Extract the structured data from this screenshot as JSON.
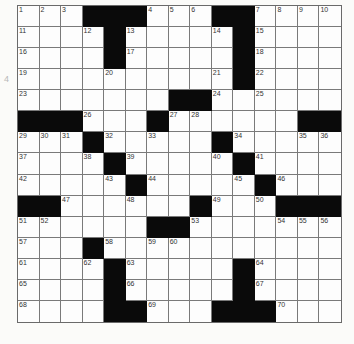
{
  "puzzle": {
    "type": "crossword",
    "rows": 15,
    "cols": 15,
    "colors": {
      "block": "#0a0a0a",
      "cell": "#fdfdfd",
      "gridline": "#7a7a7a",
      "background": "#fbfbf9"
    },
    "margin_mark": "4",
    "grid": [
      [
        "1",
        "2",
        "3",
        "#",
        "#",
        "#",
        "4",
        "5",
        "6",
        "#",
        "#",
        "7",
        "8",
        "9",
        "10"
      ],
      [
        "11",
        "",
        "",
        "12",
        "#",
        "13",
        "",
        "",
        "",
        "14",
        "#",
        "15",
        "",
        "",
        ""
      ],
      [
        "16",
        "",
        "",
        "",
        "#",
        "17",
        "",
        "",
        "",
        "",
        "#",
        "18",
        "",
        "",
        ""
      ],
      [
        "19",
        "",
        "",
        "",
        "20",
        "",
        "",
        "",
        "",
        "21",
        "#",
        "22",
        "",
        "",
        ""
      ],
      [
        "23",
        "",
        "",
        "",
        "",
        "",
        "",
        "#",
        "#",
        "24",
        "",
        "25",
        "",
        "",
        ""
      ],
      [
        "#",
        "#",
        "#",
        "26",
        "",
        "",
        "#",
        "27",
        "28",
        "",
        "",
        "",
        "",
        "#",
        "#"
      ],
      [
        "29",
        "30",
        "31",
        "#",
        "32",
        "",
        "33",
        "",
        "",
        "#",
        "34",
        "",
        "",
        "35",
        "36"
      ],
      [
        "37",
        "",
        "",
        "38",
        "#",
        "39",
        "",
        "",
        "",
        "40",
        "#",
        "41",
        "",
        "",
        ""
      ],
      [
        "42",
        "",
        "",
        "",
        "43",
        "#",
        "44",
        "",
        "",
        "",
        "45",
        "#",
        "46",
        "",
        ""
      ],
      [
        "#",
        "#",
        "47",
        "",
        "",
        "48",
        "",
        "",
        "#",
        "49",
        "",
        "50",
        "#",
        "#",
        "#"
      ],
      [
        "51",
        "52",
        "",
        "",
        "",
        "",
        "#",
        "#",
        "53",
        "",
        "",
        "",
        "54",
        "55",
        "56"
      ],
      [
        "57",
        "",
        "",
        "#",
        "58",
        "",
        "59",
        "60",
        "",
        "",
        "",
        "",
        "",
        "",
        ""
      ],
      [
        "61",
        "",
        "",
        "62",
        "#",
        "63",
        "",
        "",
        "",
        "",
        "#",
        "64",
        "",
        "",
        ""
      ],
      [
        "65",
        "",
        "",
        "",
        "#",
        "66",
        "",
        "",
        "",
        "",
        "#",
        "67",
        "",
        "",
        ""
      ],
      [
        "68",
        "",
        "",
        "",
        "#",
        "#",
        "69",
        "",
        "",
        "#",
        "#",
        "#",
        "70",
        "",
        ""
      ]
    ]
  }
}
